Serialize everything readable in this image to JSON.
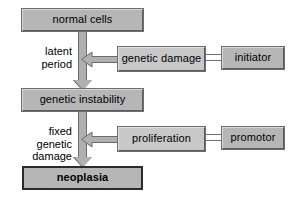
{
  "diagram": {
    "colors": {
      "box_fill": "#b6b6b6",
      "box_fill_light": "#c8c8c8",
      "arrow_fill": "#b0b0b0",
      "line": "#6e6e6e",
      "text": "#000000",
      "background": "#ffffff"
    },
    "nodes": {
      "normal_cells": "normal cells",
      "genetic_instability": "genetic instability",
      "neoplasia": "neoplasia",
      "genetic_damage": "genetic damage",
      "initiator": "initiator",
      "proliferation": "proliferation",
      "promotor": "promotor"
    },
    "labels": {
      "latent_period": "latent\nperiod",
      "fixed_genetic_damage": "fixed genetic\ndamage"
    },
    "edges": [
      {
        "from": "normal cells",
        "to": "genetic instability",
        "kind": "block-arrow-down",
        "annotation": "latent period"
      },
      {
        "from": "genetic instability",
        "to": "neoplasia",
        "kind": "block-arrow-down",
        "annotation": "fixed genetic damage"
      },
      {
        "from": "genetic damage",
        "to": "latent period",
        "kind": "block-arrow-left",
        "annotation": ""
      },
      {
        "from": "initiator",
        "to": "genetic damage",
        "kind": "double-line",
        "annotation": ""
      },
      {
        "from": "proliferation",
        "to": "fixed genetic damage",
        "kind": "block-arrow-left",
        "annotation": ""
      },
      {
        "from": "promotor",
        "to": "proliferation",
        "kind": "double-line",
        "annotation": ""
      }
    ]
  }
}
